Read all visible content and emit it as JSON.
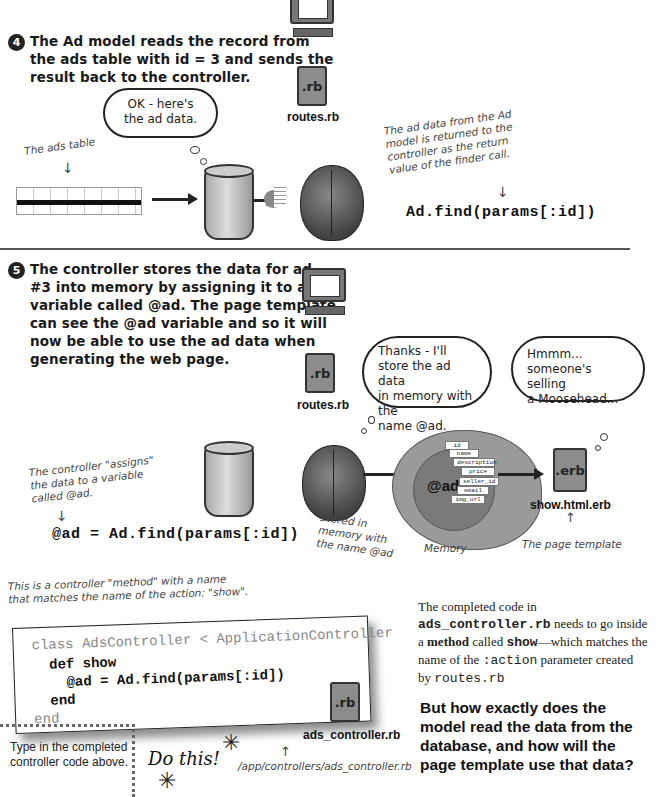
{
  "step4": {
    "number": "4",
    "text": "The Ad model reads the record from the ads table with id = 3 and sends the result back to the controller.",
    "lines": [
      "The Ad model reads the record from",
      "the ads table with id = 3 and sends the",
      "result back to the controller."
    ],
    "cloud": [
      "OK - here's",
      "the ad data."
    ],
    "ads_table_label": "The ads table",
    "routes_file_ext": ".rb",
    "routes_file_label": "routes.rb",
    "note": [
      "The ad data from the Ad",
      "model is returned to the",
      "controller as the return",
      "value of the finder call."
    ],
    "code": "Ad.find(params[:id])"
  },
  "step5": {
    "number": "5",
    "lines": [
      "The controller stores the data for ad",
      "#3 into memory by assigning it to a",
      "variable called @ad. The page template",
      "can see the @ad variable and so it will",
      "now be able to use the ad data when",
      "generating the web page."
    ],
    "routes_file_ext": ".rb",
    "routes_file_label": "routes.rb",
    "cloud_controller": [
      "Thanks - I'll",
      "store the ad data",
      "in memory with the",
      "name @ad."
    ],
    "cloud_template": [
      "Hmmm...",
      "someone's selling",
      "a Moosehead..."
    ],
    "assign_note": [
      "The controller \"assigns\"",
      "the data to a variable",
      "called @ad."
    ],
    "code": "@ad = Ad.find(params[:id])",
    "memory_var": "@ad",
    "memory_fields": [
      "id",
      "name",
      "description",
      "price",
      "seller_id",
      "email",
      "img_url"
    ],
    "stored_note": [
      "Stored in",
      "memory with",
      "the name @ad"
    ],
    "memory_label": "Memory",
    "template_file_ext": ".erb",
    "template_file_label": "show.html.erb",
    "template_note": "The page template"
  },
  "code_section": {
    "annotation": [
      "This is a controller \"method\" with a name",
      "that matches the name of the action: \"show\"."
    ],
    "code_lines": [
      "class AdsController < ApplicationController",
      "  def show",
      "    @ad = Ad.find(params[:id])",
      "  end",
      "end"
    ],
    "file_ext": ".rb",
    "file_label": "ads_controller.rb",
    "path_note": "/app/controllers/ads_controller.rb",
    "instruction": [
      "Type in the completed",
      "controller code above."
    ],
    "do_this": "Do this!",
    "explanation": {
      "p1": "The completed code in",
      "file": "ads_controller.rb",
      "p2": " needs to go inside a ",
      "method": "method",
      "p3": " called ",
      "show": "show",
      "p4": "—which matches the name of the ",
      "action": ":action",
      "p5": " parameter created by ",
      "routes": "routes.rb"
    },
    "question": [
      "But how exactly does the",
      "model read the data from the",
      "database, and how will the",
      "page template use that data?"
    ]
  }
}
